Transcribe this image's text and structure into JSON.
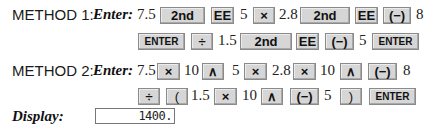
{
  "method1": {
    "label": "METHOD 1:",
    "enter_label": "Enter:",
    "line1": [
      {
        "type": "num",
        "text": "7.5"
      },
      {
        "type": "key",
        "text": "2nd"
      },
      {
        "type": "key",
        "text": "EE"
      },
      {
        "type": "num",
        "text": "5"
      },
      {
        "type": "key",
        "text": "×"
      },
      {
        "type": "num",
        "text": "2.8"
      },
      {
        "type": "key",
        "text": "2nd"
      },
      {
        "type": "key",
        "text": "EE"
      },
      {
        "type": "key",
        "text": "(−)"
      },
      {
        "type": "num",
        "text": "8"
      }
    ],
    "line2": [
      {
        "type": "key",
        "text": "ENTER"
      },
      {
        "type": "key",
        "text": "÷"
      },
      {
        "type": "num",
        "text": "1.5"
      },
      {
        "type": "key",
        "text": "2nd"
      },
      {
        "type": "key",
        "text": "EE"
      },
      {
        "type": "key",
        "text": "(−)"
      },
      {
        "type": "num",
        "text": "5"
      },
      {
        "type": "key",
        "text": "ENTER"
      }
    ]
  },
  "method2": {
    "label": "METHOD 2:",
    "enter_label": "Enter:",
    "line1": [
      {
        "type": "num",
        "text": "7.5"
      },
      {
        "type": "key",
        "text": "×"
      },
      {
        "type": "num",
        "text": "10"
      },
      {
        "type": "key",
        "text": "∧"
      },
      {
        "type": "num",
        "text": "5"
      },
      {
        "type": "key",
        "text": "×"
      },
      {
        "type": "num",
        "text": "2.8"
      },
      {
        "type": "key",
        "text": "×"
      },
      {
        "type": "num",
        "text": "10"
      },
      {
        "type": "key",
        "text": "∧"
      },
      {
        "type": "key",
        "text": "(−)"
      },
      {
        "type": "num",
        "text": "8"
      }
    ],
    "line2": [
      {
        "type": "key",
        "text": "÷"
      },
      {
        "type": "key",
        "text": "("
      },
      {
        "type": "num",
        "text": "1.5"
      },
      {
        "type": "key",
        "text": "×"
      },
      {
        "type": "num",
        "text": "10"
      },
      {
        "type": "key",
        "text": "∧"
      },
      {
        "type": "key",
        "text": "(−)"
      },
      {
        "type": "num",
        "text": "5"
      },
      {
        "type": "key",
        "text": ")"
      },
      {
        "type": "key",
        "text": "ENTER"
      }
    ]
  },
  "display": {
    "label": "Display:",
    "value": "1400."
  }
}
